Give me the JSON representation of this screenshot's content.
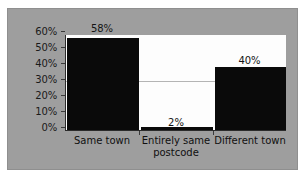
{
  "chart_data": {
    "type": "bar",
    "title": "",
    "xlabel": "",
    "ylabel": "",
    "categories": [
      "Same town",
      "Entirely same postcode",
      "Different town"
    ],
    "values": [
      58,
      2,
      40
    ],
    "data_labels": [
      "58%",
      "2%",
      "40%"
    ],
    "ylim": [
      0,
      60
    ],
    "ytick_values": [
      0,
      10,
      20,
      30,
      40,
      50,
      60
    ],
    "ytick_labels": [
      "0%",
      "10%",
      "20%",
      "30%",
      "40%",
      "50%",
      "60%"
    ],
    "grid": true,
    "legend": "none",
    "colors": {
      "bar": "#0a0a0a",
      "plot_background": "#fdfdfd",
      "figure_background": "#9e9e9e",
      "axis": "#2b2b2b",
      "text": "#141414"
    }
  },
  "axis": {
    "y": {
      "t0": "0%",
      "t1": "10%",
      "t2": "20%",
      "t3": "30%",
      "t4": "40%",
      "t5": "50%",
      "t6": "60%"
    },
    "x": {
      "cat0_line1": "Same town",
      "cat0_line2": "",
      "cat1_line1": "Entirely same",
      "cat1_line2": "postcode",
      "cat2_line1": "Different town",
      "cat2_line2": ""
    }
  },
  "labels": {
    "bar0": "58%",
    "bar1": "2%",
    "bar2": "40%"
  }
}
